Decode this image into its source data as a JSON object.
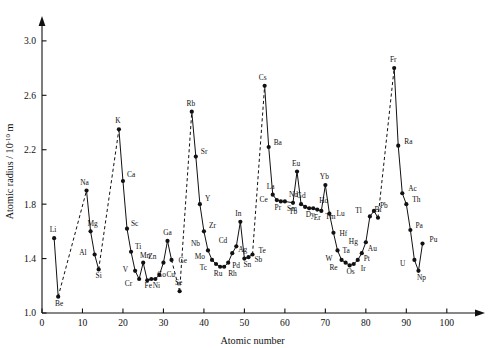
{
  "chart_data": {
    "type": "line",
    "title": "",
    "xlabel": "Atomic number",
    "ylabel": "Atomic radius / 10",
    "ylabel_exponent": "-10",
    "ylabel_unit": "m",
    "xlim": [
      0,
      104
    ],
    "ylim": [
      1.0,
      3.08
    ],
    "xticks": [
      0,
      10,
      20,
      30,
      40,
      50,
      60,
      70,
      80,
      90,
      100
    ],
    "xticklabels": [
      "0",
      "10",
      "20",
      "30",
      "40",
      "50",
      "60",
      "70",
      "80",
      "90",
      "100"
    ],
    "yticks": [
      1.0,
      1.4,
      1.8,
      2.2,
      2.6,
      3.0
    ],
    "yticklabels": [
      "1.0",
      "1.4",
      "1.8",
      "2.2",
      "2.6",
      "3.0"
    ],
    "grid": false,
    "legend": null,
    "axis_arrows": true,
    "marker": "filled-circle",
    "line_note": "solid segments connect consecutive labelled elements; dashed segments bridge the noble-gas gaps",
    "x": [
      3,
      4,
      11,
      12,
      13,
      14,
      19,
      20,
      21,
      22,
      23,
      24,
      25,
      26,
      27,
      28,
      29,
      30,
      31,
      32,
      34,
      37,
      38,
      39,
      40,
      41,
      42,
      43,
      44,
      45,
      46,
      47,
      48,
      49,
      50,
      51,
      52,
      55,
      56,
      57,
      58,
      59,
      60,
      62,
      63,
      64,
      65,
      66,
      67,
      68,
      69,
      70,
      71,
      72,
      73,
      74,
      75,
      76,
      77,
      78,
      79,
      80,
      81,
      82,
      83,
      87,
      88,
      89,
      90,
      91,
      92,
      93,
      94
    ],
    "values": [
      1.55,
      1.12,
      1.9,
      1.6,
      1.43,
      1.32,
      2.35,
      1.97,
      1.62,
      1.45,
      1.31,
      1.25,
      1.37,
      1.24,
      1.25,
      1.25,
      1.28,
      1.37,
      1.53,
      1.39,
      1.16,
      2.48,
      2.15,
      1.8,
      1.6,
      1.46,
      1.39,
      1.36,
      1.34,
      1.34,
      1.37,
      1.44,
      1.49,
      1.67,
      1.4,
      1.41,
      1.43,
      2.67,
      2.22,
      1.87,
      1.83,
      1.82,
      1.82,
      1.81,
      2.04,
      1.8,
      1.78,
      1.77,
      1.77,
      1.76,
      1.75,
      1.94,
      1.73,
      1.59,
      1.46,
      1.39,
      1.37,
      1.35,
      1.36,
      1.39,
      1.44,
      1.52,
      1.71,
      1.75,
      1.7,
      2.8,
      2.23,
      1.88,
      1.8,
      1.61,
      1.39,
      1.31,
      1.51
    ],
    "labels": [
      "Li",
      "Be",
      "Na",
      "Mg",
      "Al",
      "Si",
      "K",
      "Ca",
      "Sc",
      "Ti",
      "V",
      "Cr",
      "Mn",
      "Fe",
      "Co",
      "Ni",
      "Cu",
      "Zn",
      "Ga",
      "Ge",
      "Se",
      "Rb",
      "Sr",
      "Y",
      "Zr",
      "Nb",
      "Mo",
      "Tc",
      "Ru",
      "Rh",
      "Pd",
      "Ag",
      "Cd",
      "In",
      "Sn",
      "Sb",
      "Te",
      "Cs",
      "Ba",
      "La",
      "Ce",
      "Pr",
      "Nd",
      "Sm",
      "Eu",
      "Gd",
      "Tb",
      "Dy",
      "Ho",
      "Er",
      "Tm",
      "Yb",
      "Lu",
      "Hf",
      "Ta",
      "W",
      "Re",
      "Os",
      "Ir",
      "Pt",
      "Au",
      "Hg",
      "Tl",
      "Pb",
      "Bi",
      "Fr",
      "Ra",
      "Ac",
      "Th",
      "Pa",
      "U",
      "Np",
      "Pu"
    ],
    "label_offsets": [
      [
        -1,
        -6
      ],
      [
        1,
        9
      ],
      [
        -2,
        -6
      ],
      [
        2,
        -5
      ],
      [
        -8,
        0
      ],
      [
        0,
        9
      ],
      [
        -1,
        -6
      ],
      [
        4,
        -4
      ],
      [
        4,
        -3
      ],
      [
        4,
        -3
      ],
      [
        -7,
        1
      ],
      [
        -7,
        7
      ],
      [
        2,
        -5
      ],
      [
        1,
        8
      ],
      [
        6,
        -2
      ],
      [
        1,
        9
      ],
      [
        7,
        2
      ],
      [
        -7,
        -4
      ],
      [
        0,
        -6
      ],
      [
        7,
        3
      ],
      [
        -1,
        -6
      ],
      [
        -1,
        -6
      ],
      [
        5,
        -3
      ],
      [
        5,
        -3
      ],
      [
        5,
        -3
      ],
      [
        -8,
        -4
      ],
      [
        -7,
        -1
      ],
      [
        -9,
        6
      ],
      [
        -2,
        9
      ],
      [
        4,
        9
      ],
      [
        4,
        5
      ],
      [
        6,
        -1
      ],
      [
        -9,
        -3
      ],
      [
        -2,
        -6
      ],
      [
        3,
        8
      ],
      [
        6,
        5
      ],
      [
        6,
        -2
      ],
      [
        -2,
        -6
      ],
      [
        5,
        -2
      ],
      [
        -2,
        -6
      ],
      [
        -9,
        2
      ],
      [
        -3,
        9
      ],
      [
        4,
        -4
      ],
      [
        -1,
        8
      ],
      [
        -1,
        -6
      ],
      [
        0,
        -6
      ],
      [
        -8,
        7
      ],
      [
        1,
        9
      ],
      [
        6,
        -5
      ],
      [
        0,
        10
      ],
      [
        4,
        8
      ],
      [
        -1,
        -6
      ],
      [
        7,
        2
      ],
      [
        6,
        3
      ],
      [
        5,
        3
      ],
      [
        -9,
        1
      ],
      [
        -8,
        7
      ],
      [
        1,
        9
      ],
      [
        7,
        7
      ],
      [
        6,
        1
      ],
      [
        6,
        -2
      ],
      [
        -8,
        2
      ],
      [
        -8,
        -3
      ],
      [
        6,
        -3
      ],
      [
        0,
        -6
      ],
      [
        -1,
        -6
      ],
      [
        6,
        -2
      ],
      [
        6,
        -2
      ],
      [
        6,
        -2
      ],
      [
        5,
        -2
      ],
      [
        -9,
        6
      ],
      [
        3,
        9
      ],
      [
        7,
        -2
      ]
    ],
    "solid_runs": [
      [
        3,
        4
      ],
      [
        11,
        12,
        13,
        14
      ],
      [
        19,
        20,
        21,
        22,
        23,
        24,
        25,
        26,
        27,
        28,
        29,
        30,
        31,
        32
      ],
      [
        37,
        38,
        39,
        40,
        41,
        42,
        43,
        44,
        45,
        46,
        47,
        48,
        49,
        50,
        51,
        52
      ],
      [
        55,
        56,
        57,
        58,
        59,
        60,
        62,
        63,
        64,
        65,
        66,
        67,
        68,
        69,
        70,
        71,
        72,
        73,
        74,
        75,
        76,
        77,
        78,
        79,
        80,
        81,
        82,
        83
      ],
      [
        87,
        88,
        89,
        90,
        91,
        92,
        93,
        94
      ]
    ],
    "dashed_runs": [
      [
        4,
        11
      ],
      [
        14,
        19
      ],
      [
        32,
        34
      ],
      [
        34,
        37
      ],
      [
        52,
        55
      ],
      [
        83,
        87
      ]
    ]
  }
}
